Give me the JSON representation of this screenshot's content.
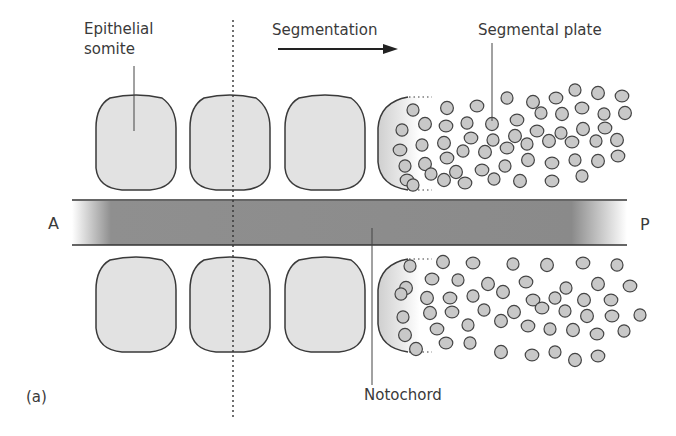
{
  "labels": {
    "epithelial_somite_line1": "Epithelial",
    "epithelial_somite_line2": "somite",
    "segmentation": "Segmentation",
    "segmental_plate": "Segmental plate",
    "anterior": "A",
    "posterior": "P",
    "notochord": "Notochord",
    "panel": "(a)"
  },
  "colors": {
    "somite_fill": "#e2e2e2",
    "somite_stroke": "#3a3a3a",
    "cell_fill": "#c8c8c8",
    "notochord_fill": "#8c8c8c",
    "line": "#333333"
  },
  "somites": [
    {
      "x": 96,
      "w": 80
    },
    {
      "x": 190,
      "w": 80
    },
    {
      "x": 285,
      "w": 80
    }
  ],
  "upper_cells": [
    [
      413,
      110
    ],
    [
      447,
      108
    ],
    [
      477,
      106
    ],
    [
      507,
      98
    ],
    [
      533,
      102
    ],
    [
      556,
      98
    ],
    [
      575,
      90
    ],
    [
      598,
      93
    ],
    [
      622,
      96
    ],
    [
      402,
      130
    ],
    [
      425,
      124
    ],
    [
      446,
      126
    ],
    [
      467,
      123
    ],
    [
      492,
      124
    ],
    [
      517,
      120
    ],
    [
      541,
      113
    ],
    [
      562,
      114
    ],
    [
      582,
      108
    ],
    [
      604,
      114
    ],
    [
      625,
      113
    ],
    [
      400,
      150
    ],
    [
      422,
      145
    ],
    [
      444,
      143
    ],
    [
      471,
      138
    ],
    [
      493,
      140
    ],
    [
      515,
      136
    ],
    [
      537,
      131
    ],
    [
      561,
      133
    ],
    [
      583,
      129
    ],
    [
      605,
      128
    ],
    [
      405,
      166
    ],
    [
      425,
      164
    ],
    [
      447,
      158
    ],
    [
      463,
      151
    ],
    [
      485,
      152
    ],
    [
      507,
      148
    ],
    [
      527,
      144
    ],
    [
      549,
      141
    ],
    [
      572,
      142
    ],
    [
      596,
      141
    ],
    [
      617,
      140
    ],
    [
      407,
      180
    ],
    [
      431,
      174
    ],
    [
      456,
      172
    ],
    [
      482,
      170
    ],
    [
      505,
      166
    ],
    [
      528,
      160
    ],
    [
      552,
      163
    ],
    [
      575,
      160
    ],
    [
      598,
      161
    ],
    [
      618,
      156
    ],
    [
      413,
      185
    ],
    [
      444,
      180
    ],
    [
      465,
      183
    ],
    [
      494,
      179
    ],
    [
      520,
      181
    ],
    [
      552,
      181
    ],
    [
      582,
      176
    ]
  ],
  "lower_cells": [
    [
      410,
      266
    ],
    [
      443,
      262
    ],
    [
      473,
      263
    ],
    [
      513,
      264
    ],
    [
      547,
      265
    ],
    [
      583,
      263
    ],
    [
      617,
      265
    ],
    [
      406,
      288
    ],
    [
      432,
      279
    ],
    [
      458,
      280
    ],
    [
      488,
      284
    ],
    [
      526,
      282
    ],
    [
      566,
      288
    ],
    [
      598,
      284
    ],
    [
      630,
      286
    ],
    [
      401,
      294
    ],
    [
      427,
      298
    ],
    [
      450,
      298
    ],
    [
      473,
      296
    ],
    [
      503,
      292
    ],
    [
      533,
      300
    ],
    [
      555,
      298
    ],
    [
      584,
      300
    ],
    [
      611,
      300
    ],
    [
      403,
      317
    ],
    [
      430,
      313
    ],
    [
      452,
      312
    ],
    [
      484,
      310
    ],
    [
      514,
      312
    ],
    [
      542,
      308
    ],
    [
      565,
      311
    ],
    [
      587,
      316
    ],
    [
      612,
      316
    ],
    [
      640,
      315
    ],
    [
      405,
      335
    ],
    [
      437,
      329
    ],
    [
      468,
      325
    ],
    [
      501,
      321
    ],
    [
      528,
      326
    ],
    [
      550,
      329
    ],
    [
      573,
      330
    ],
    [
      597,
      334
    ],
    [
      624,
      331
    ],
    [
      416,
      349
    ],
    [
      446,
      343
    ],
    [
      470,
      343
    ],
    [
      501,
      352
    ],
    [
      532,
      355
    ],
    [
      555,
      352
    ],
    [
      575,
      360
    ],
    [
      598,
      356
    ]
  ]
}
